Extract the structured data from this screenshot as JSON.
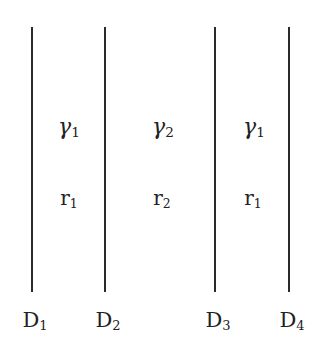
{
  "diagram": {
    "boundaries": [
      {
        "label": "D",
        "sub": "1",
        "x": 32
      },
      {
        "label": "D",
        "sub": "2",
        "x": 105
      },
      {
        "label": "D",
        "sub": "3",
        "x": 215
      },
      {
        "label": "D",
        "sub": "4",
        "x": 289
      }
    ],
    "regions": [
      {
        "gamma": "γ",
        "gamma_sub": "1",
        "r": "r",
        "r_sub": "1",
        "x": 69
      },
      {
        "gamma": "γ",
        "gamma_sub": "2",
        "r": "r",
        "r_sub": "2",
        "x": 161
      },
      {
        "gamma": "γ",
        "gamma_sub": "1",
        "r": "r",
        "r_sub": "1",
        "x": 253
      }
    ]
  }
}
